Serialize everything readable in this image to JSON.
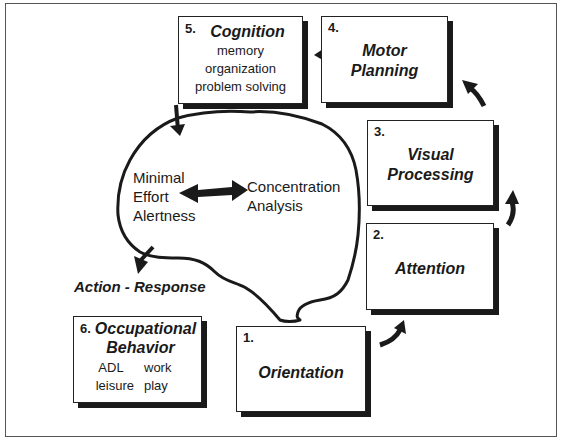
{
  "diagram": {
    "steps": [
      {
        "number": "1.",
        "title": "Orientation",
        "items": []
      },
      {
        "number": "2.",
        "title": "Attention",
        "items": []
      },
      {
        "number": "3.",
        "title_lines": [
          "Visual",
          "Processing"
        ],
        "items": []
      },
      {
        "number": "4.",
        "title_lines": [
          "Motor",
          "Planning"
        ],
        "items": []
      },
      {
        "number": "5.",
        "title": "Cognition",
        "items": [
          "memory",
          "organization",
          "problem solving"
        ]
      },
      {
        "number": "6.",
        "title_lines": [
          "Occupational",
          "Behavior"
        ],
        "items": [
          "ADL",
          "work",
          "leisure",
          "play"
        ]
      }
    ],
    "brain": {
      "left_lines": [
        "Minimal",
        "Effort",
        "Alertness"
      ],
      "right_lines": [
        "Concentration",
        "Analysis"
      ],
      "arrow": "double-headed"
    },
    "output_label": "Action - Response",
    "colors": {
      "ink": "#1a1a1a",
      "background": "#ffffff",
      "frame": "#555555"
    }
  }
}
